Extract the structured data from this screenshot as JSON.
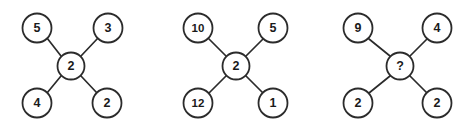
{
  "figure": {
    "type": "number-puzzle-diagram",
    "background_color": "#ffffff",
    "stroke_color": "#2b2b2b",
    "text_color": "#1a1a1a",
    "node_radius": 14.5,
    "center_radius": 13.5,
    "layout": "three X-shaped clusters, each with four outer circles and one center circle"
  },
  "clusters": [
    {
      "id": "cluster-1",
      "origin_x": 0,
      "center": {
        "value": "2",
        "cx": 71,
        "cy": 66
      },
      "nodes": [
        {
          "position": "top-left",
          "value": "5",
          "cx": 37,
          "cy": 28
        },
        {
          "position": "top-right",
          "value": "3",
          "cx": 108,
          "cy": 28
        },
        {
          "position": "bottom-left",
          "value": "4",
          "cx": 37,
          "cy": 103
        },
        {
          "position": "bottom-right",
          "value": "2",
          "cx": 107,
          "cy": 103
        }
      ]
    },
    {
      "id": "cluster-2",
      "origin_x": 154,
      "center": {
        "value": "2",
        "cx": 82,
        "cy": 66
      },
      "nodes": [
        {
          "position": "top-left",
          "value": "10",
          "cx": 44,
          "cy": 28
        },
        {
          "position": "top-right",
          "value": "5",
          "cx": 119,
          "cy": 28
        },
        {
          "position": "bottom-left",
          "value": "12",
          "cx": 44,
          "cy": 103
        },
        {
          "position": "bottom-right",
          "value": "1",
          "cx": 119,
          "cy": 103
        }
      ]
    },
    {
      "id": "cluster-3",
      "origin_x": 307,
      "center": {
        "value": "?",
        "cx": 93,
        "cy": 66
      },
      "nodes": [
        {
          "position": "top-left",
          "value": "9",
          "cx": 51,
          "cy": 28
        },
        {
          "position": "top-right",
          "value": "4",
          "cx": 130,
          "cy": 28
        },
        {
          "position": "bottom-left",
          "value": "2",
          "cx": 51,
          "cy": 103
        },
        {
          "position": "bottom-right",
          "value": "2",
          "cx": 130,
          "cy": 103
        }
      ]
    }
  ]
}
